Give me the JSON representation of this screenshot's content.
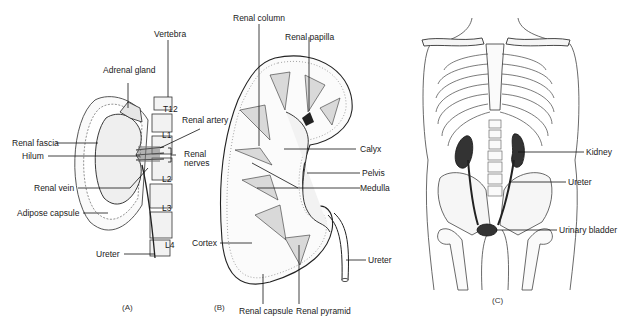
{
  "figure": {
    "panels": [
      {
        "id": "A",
        "caption": "(A)",
        "labels": {
          "vertebra": "Vertebra",
          "adrenal_gland": "Adrenal gland",
          "t12": "T12",
          "l1": "L1",
          "l2": "L2",
          "l3": "L3",
          "l4": "L4",
          "renal_artery": "Renal artery",
          "renal_fascia": "Renal fascia",
          "renal_nerves_1": "Renal",
          "renal_nerves_2": "nerves",
          "hilum": "Hilum",
          "renal_vein": "Renal vein",
          "adipose_capsule": "Adipose capsule",
          "ureter": "Ureter"
        }
      },
      {
        "id": "B",
        "caption": "(B)",
        "labels": {
          "renal_column": "Renal column",
          "renal_papilla": "Renal papilla",
          "calyx": "Calyx",
          "pelvis": "Pelvis",
          "medulla": "Medulla",
          "cortex": "Cortex",
          "ureter": "Ureter",
          "renal_capsule": "Renal capsule",
          "renal_pyramid": "Renal pyramid"
        }
      },
      {
        "id": "C",
        "caption": "(C)",
        "labels": {
          "kidney": "Kidney",
          "ureter": "Ureter",
          "urinary_bladder": "Urinary bladder"
        }
      }
    ]
  }
}
